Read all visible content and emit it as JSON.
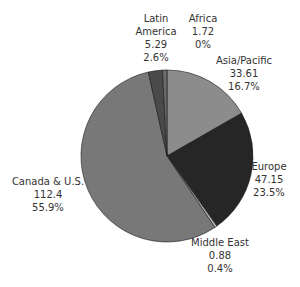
{
  "chart_data": {
    "type": "pie",
    "title": "",
    "start_angle_deg": 0,
    "direction": "clockwise",
    "slices": [
      {
        "name": "Asia/Pacific",
        "value": 33.61,
        "percent": "16.7%",
        "value_label": "33.61",
        "color": "#8c8c8c"
      },
      {
        "name": "Europe",
        "value": 47.15,
        "percent": "23.5%",
        "value_label": "47.15",
        "color": "#262626"
      },
      {
        "name": "Middle East",
        "value": 0.88,
        "percent": "0.4%",
        "value_label": "0.88",
        "color": "#bdbdbd"
      },
      {
        "name": "Canada & U.S.",
        "value": 112.4,
        "percent": "55.9%",
        "value_label": "112.4",
        "color": "#787878"
      },
      {
        "name": "Latin America",
        "value": 5.29,
        "percent": "2.6%",
        "value_label": "5.29",
        "color": "#4a4a4a"
      },
      {
        "name": "Africa",
        "value": 1.72,
        "percent": "0%",
        "value_label": "1.72",
        "color": "#6a6a6a"
      }
    ],
    "categories": [
      "Asia/Pacific",
      "Europe",
      "Middle East",
      "Canada & U.S.",
      "Latin America",
      "Africa"
    ],
    "values": [
      33.61,
      47.15,
      0.88,
      112.4,
      5.29,
      1.72
    ],
    "percentages": [
      16.7,
      23.5,
      0.4,
      55.9,
      2.6,
      0
    ],
    "legend": "none (labels placed next to slices)"
  },
  "labels": {
    "latin_america": {
      "line1": "Latin",
      "line2": "America",
      "value": "5.29",
      "pct": "2.6%"
    },
    "africa": {
      "line1": "Africa",
      "value": "1.72",
      "pct": "0%"
    },
    "asia_pacific": {
      "line1": "Asia/Pacific",
      "value": "33.61",
      "pct": "16.7%"
    },
    "europe": {
      "line1": "Europe",
      "value": "47.15",
      "pct": "23.5%"
    },
    "middle_east": {
      "line1": "Middle East",
      "value": "0.88",
      "pct": "0.4%"
    },
    "canada_us": {
      "line1": "Canada & U.S.",
      "value": "112.4",
      "pct": "55.9%"
    }
  }
}
